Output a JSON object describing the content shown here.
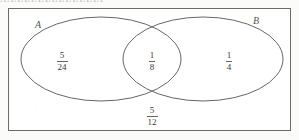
{
  "figure": {
    "type": "venn-diagram",
    "sets": [
      {
        "id": "A",
        "label": "A"
      },
      {
        "id": "B",
        "label": "B"
      }
    ],
    "regions": [
      {
        "id": "left-only",
        "meaning": "A only",
        "numerator": "5",
        "denominator": "24"
      },
      {
        "id": "both",
        "meaning": "A intersect B",
        "numerator": "1",
        "denominator": "8"
      },
      {
        "id": "right-only",
        "meaning": "B only",
        "numerator": "1",
        "denominator": "4"
      },
      {
        "id": "outside",
        "meaning": "neither A nor B",
        "numerator": "5",
        "denominator": "12"
      }
    ],
    "colors": {
      "stroke": "#555555",
      "frame": "#6b6b6b",
      "text": "#3a3a3a",
      "background": "#fbfbfa"
    },
    "top_cut_text": "AAAAAAAAAAAAAAA"
  }
}
